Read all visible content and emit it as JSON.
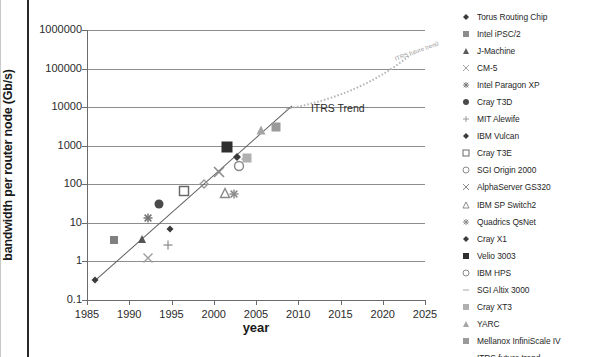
{
  "chart_data": {
    "type": "scatter",
    "title": "",
    "xlabel": "year",
    "ylabel": "bandwidth per router node (Gb/s)",
    "xlim": [
      1985,
      2025
    ],
    "ylim": [
      0.1,
      1000000
    ],
    "yscale": "log",
    "grid": true,
    "legend_position": "right",
    "xticks": [
      "1985",
      "1990",
      "1995",
      "2000",
      "2005",
      "2010",
      "2015",
      "2020",
      "2025"
    ],
    "yticks": [
      "0.1",
      "1",
      "10",
      "100",
      "1000",
      "10000",
      "100000",
      "1000000"
    ],
    "annotations": [
      {
        "text": "ITRS Trend",
        "x": 2011.5,
        "y": 9000
      },
      {
        "text": "ITRS future trend",
        "x": 2021.5,
        "y": 170000
      }
    ],
    "series": [
      {
        "name": "Torus Routing Chip",
        "marker": "diamond",
        "color": "#3b3b3b",
        "size": 7,
        "points": [
          {
            "x": 1986,
            "y": 0.34
          }
        ]
      },
      {
        "name": "Intel iPSC/2",
        "marker": "square",
        "color": "#808080",
        "size": 8,
        "points": [
          {
            "x": 1988.2,
            "y": 3.5
          }
        ]
      },
      {
        "name": "J-Machine",
        "marker": "triangle",
        "color": "#555555",
        "size": 8,
        "points": [
          {
            "x": 1991.5,
            "y": 3.8
          }
        ]
      },
      {
        "name": "CM-5",
        "marker": "x",
        "color": "#a0a0a0",
        "size": 9,
        "points": [
          {
            "x": 1992.2,
            "y": 1.25
          }
        ]
      },
      {
        "name": "Intel Paragon XP",
        "marker": "asterisk",
        "color": "#707070",
        "size": 9,
        "points": [
          {
            "x": 1992.2,
            "y": 13
          }
        ]
      },
      {
        "name": "Cray T3D",
        "marker": "circle",
        "color": "#4a4a4a",
        "size": 9,
        "points": [
          {
            "x": 1993.5,
            "y": 30
          }
        ]
      },
      {
        "name": "MIT Alewife",
        "marker": "plus",
        "color": "#9a9a9a",
        "size": 9,
        "points": [
          {
            "x": 1994.6,
            "y": 2.7
          }
        ]
      },
      {
        "name": "IBM Vulcan",
        "marker": "diamond",
        "color": "#3b3b3b",
        "size": 7,
        "points": [
          {
            "x": 1994.8,
            "y": 6.8
          }
        ]
      },
      {
        "name": "Cray T3E",
        "marker": "open-square",
        "color": "#666666",
        "size": 9,
        "points": [
          {
            "x": 1996.5,
            "y": 66
          }
        ]
      },
      {
        "name": "SGI Origin 2000",
        "marker": "open-diamond",
        "color": "#999999",
        "size": 8,
        "points": [
          {
            "x": 1998.8,
            "y": 102
          }
        ]
      },
      {
        "name": "AlphaServer GS320",
        "marker": "x",
        "color": "#8a8a8a",
        "size": 10,
        "points": [
          {
            "x": 2000.6,
            "y": 210
          }
        ]
      },
      {
        "name": "IBM SP Switch2",
        "marker": "open-triangle",
        "color": "#8a8a8a",
        "size": 9,
        "points": [
          {
            "x": 2001.3,
            "y": 60
          }
        ]
      },
      {
        "name": "Quadrics QsNet",
        "marker": "asterisk",
        "color": "#8a8a8a",
        "size": 9,
        "points": [
          {
            "x": 2002.4,
            "y": 56
          }
        ]
      },
      {
        "name": "Cray X1",
        "marker": "diamond",
        "color": "#3b3b3b",
        "size": 8,
        "points": [
          {
            "x": 2002.7,
            "y": 520
          }
        ]
      },
      {
        "name": "Velio 3003",
        "marker": "square",
        "color": "#2f2f2f",
        "size": 11,
        "points": [
          {
            "x": 2001.6,
            "y": 950
          }
        ]
      },
      {
        "name": "IBM HPS",
        "marker": "open-circle",
        "color": "#8a8a8a",
        "size": 9,
        "points": [
          {
            "x": 2003.0,
            "y": 300
          }
        ]
      },
      {
        "name": "SGI Altix 3000",
        "marker": "dash",
        "color": "#a8a8a8",
        "size": 9,
        "points": [
          {
            "x": 2003.8,
            "y": 440
          }
        ]
      },
      {
        "name": "Cray XT3",
        "marker": "square",
        "color": "#b0b0b0",
        "size": 9,
        "points": [
          {
            "x": 2003.9,
            "y": 470
          }
        ]
      },
      {
        "name": "YARC",
        "marker": "triangle",
        "color": "#a5a5a5",
        "size": 9,
        "points": [
          {
            "x": 2005.6,
            "y": 2500
          }
        ]
      },
      {
        "name": "Mellanox InfiniScale IV",
        "marker": "square",
        "color": "#9a9a9a",
        "size": 9,
        "points": [
          {
            "x": 2007.4,
            "y": 3000
          }
        ]
      }
    ],
    "trend_fit": {
      "name": "historical trend",
      "x0": 1986,
      "y0": 0.34,
      "x1": 2009.3,
      "y1": 11500
    },
    "itrs_future": {
      "name": "ITRS future trend",
      "x0": 2008.6,
      "y0": 9000,
      "x1": 2023.3,
      "y1": 230000
    }
  },
  "legend": {
    "items": [
      {
        "label": "Torus Routing Chip",
        "marker": "diamond",
        "color": "#3b3b3b"
      },
      {
        "label": "Intel iPSC/2",
        "marker": "square",
        "color": "#8c8c8c"
      },
      {
        "label": "J-Machine",
        "marker": "triangle",
        "color": "#5a5a5a"
      },
      {
        "label": "CM-5",
        "marker": "x",
        "color": "#a0a0a0"
      },
      {
        "label": "Intel Paragon XP",
        "marker": "asterisk",
        "color": "#7a7a7a"
      },
      {
        "label": "Cray T3D",
        "marker": "circle",
        "color": "#4a4a4a"
      },
      {
        "label": "MIT Alewife",
        "marker": "plus",
        "color": "#9a9a9a"
      },
      {
        "label": "IBM Vulcan",
        "marker": "diamond",
        "color": "#3b3b3b"
      },
      {
        "label": "Cray T3E",
        "marker": "open-square",
        "color": "#6a6a6a"
      },
      {
        "label": "SGI Origin 2000",
        "marker": "open-circle",
        "color": "#8a8a8a"
      },
      {
        "label": "AlphaServer GS320",
        "marker": "x",
        "color": "#8a8a8a"
      },
      {
        "label": "IBM SP Switch2",
        "marker": "open-triangle",
        "color": "#8a8a8a"
      },
      {
        "label": "Quadrics QsNet",
        "marker": "asterisk",
        "color": "#8a8a8a"
      },
      {
        "label": "Cray X1",
        "marker": "diamond",
        "color": "#3b3b3b"
      },
      {
        "label": "Velio 3003",
        "marker": "square",
        "color": "#2f2f2f"
      },
      {
        "label": "IBM HPS",
        "marker": "open-circle",
        "color": "#8a8a8a"
      },
      {
        "label": "SGI Altix 3000",
        "marker": "dash",
        "color": "#a8a8a8"
      },
      {
        "label": "Cray XT3",
        "marker": "square",
        "color": "#b0b0b0"
      },
      {
        "label": "YARC",
        "marker": "triangle",
        "color": "#a5a5a5"
      },
      {
        "label": "Mellanox InfiniScale IV",
        "marker": "square",
        "color": "#9a9a9a"
      },
      {
        "label": "ITRS future trend",
        "marker": "dotted-line",
        "color": "#b4b4b4"
      }
    ]
  }
}
